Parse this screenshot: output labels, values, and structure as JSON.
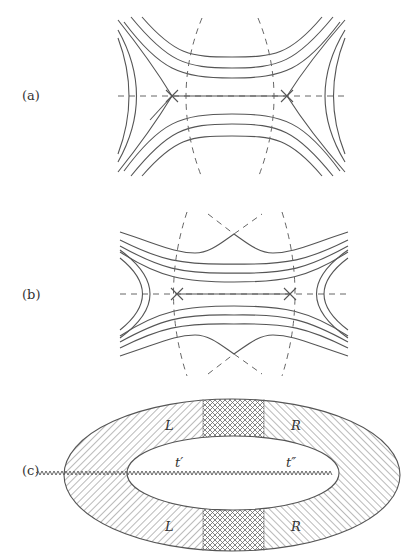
{
  "figure": {
    "panels": [
      {
        "id": "a",
        "label": "(a)",
        "description": "Field lines with two X-points on a dashed horizontal axis, dashed separatrix lines"
      },
      {
        "id": "b",
        "label": "(b)",
        "description": "Field lines with two X-points plus cusp-shaped outer lines where dashed lines cross"
      },
      {
        "id": "c",
        "label": "(c)",
        "description": "Hatched annular ellipse with cross-hatched bands top and bottom and a wavy branch cut"
      }
    ],
    "panel_c": {
      "region_labels": {
        "left_top": "L",
        "right_top": "R",
        "left_bottom": "L",
        "right_bottom": "R"
      },
      "cut_labels": {
        "start": "t′",
        "end": "t″"
      }
    },
    "colors": {
      "line": "#555555",
      "dashed": "#666666",
      "background": "#ffffff"
    }
  }
}
